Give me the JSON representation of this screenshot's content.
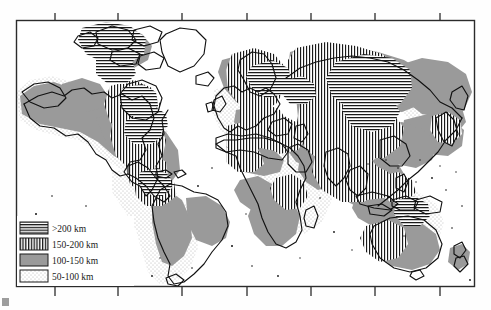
{
  "figure": {
    "type": "thematic-world-map",
    "frame": {
      "left": 16,
      "top": 20,
      "right": 475,
      "bottom": 287,
      "border_color": "#2b2b2b"
    },
    "background_color": "#ffffff",
    "land_outline_color": "#111111"
  },
  "legend": {
    "name": "map-legend",
    "box": {
      "left": 16,
      "top": 216,
      "width": 118,
      "height": 70
    },
    "items": [
      {
        "label": ">200 km",
        "pattern": "horizontal-lines",
        "fill": "#ffffff",
        "ink": "#1a1a1a"
      },
      {
        "label": "150-200 km",
        "pattern": "vertical-lines",
        "fill": "#ffffff",
        "ink": "#1a1a1a"
      },
      {
        "label": "100-150 km",
        "pattern": "solid-gray",
        "fill": "#9a9a9a",
        "ink": "#9a9a9a"
      },
      {
        "label": "50-100 km",
        "pattern": "stipple-dots",
        "fill": "#ffffff",
        "ink": "#b9b9b9"
      }
    ]
  },
  "axes": {
    "top_ticks": [
      55,
      118,
      182,
      247,
      311,
      375,
      440
    ],
    "bottom_ticks": [
      55,
      118,
      182,
      247,
      311,
      375,
      440
    ],
    "tick_length": 7,
    "tick_direction": "outward",
    "tick_color": "#2b2b2b",
    "tick_labels": []
  },
  "colors": {
    "gray_fill": "#9a9a9a",
    "stipple_ink": "#b9b9b9",
    "hatch_ink": "#1a1a1a",
    "frame": "#2b2b2b",
    "coastline": "#111111"
  }
}
